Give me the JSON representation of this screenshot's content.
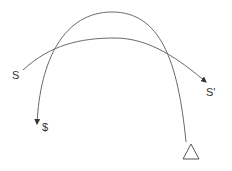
{
  "diagram": {
    "type": "curved-arrow-diagram",
    "labels": {
      "start_s": "S",
      "end_s_prime": "S'",
      "end_dollar": "$"
    },
    "shapes": {
      "triangle": "open-triangle-marker"
    },
    "arrows": [
      {
        "from": "triangle",
        "to": "$",
        "shape": "high-arc",
        "arrowhead": "filled"
      },
      {
        "from": "S",
        "to": "S'",
        "shape": "low-arc",
        "arrowhead": "filled"
      }
    ],
    "colors": {
      "stroke": "#6a6a6a",
      "text": "#333333",
      "background": "#ffffff"
    }
  }
}
